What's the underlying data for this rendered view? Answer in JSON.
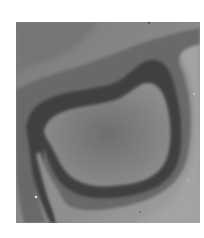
{
  "image": {
    "kind": "grayscale micrograph-like image",
    "colors": {
      "background_outer": "#8a8a8a",
      "upper_band": "#777777",
      "outer_halo": "#6c6c6c",
      "ring_dark": "#3f3f3f",
      "inner_region": "#848484",
      "inner_shadow": "#747474",
      "right_light": "#a4a4a4",
      "lower_light": "#9a9a9a"
    }
  }
}
